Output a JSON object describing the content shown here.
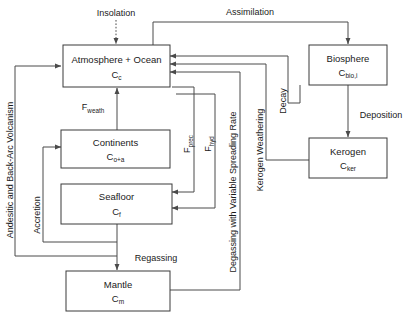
{
  "diagram": {
    "colors": {
      "background": "#ffffff",
      "box_stroke": "#3a3a3a",
      "line": "#4a4a4a",
      "text": "#1a1a1a"
    },
    "boxes": [
      {
        "id": "atmosphere-ocean",
        "label": "Atmosphere + Ocean",
        "symbol_base": "C",
        "symbol_sub": "c"
      },
      {
        "id": "continents",
        "label": "Continents",
        "symbol_base": "C",
        "symbol_sub": "o+a"
      },
      {
        "id": "seafloor",
        "label": "Seafloor",
        "symbol_base": "C",
        "symbol_sub": "f"
      },
      {
        "id": "mantle",
        "label": "Mantle",
        "symbol_base": "C",
        "symbol_sub": "m"
      },
      {
        "id": "biosphere",
        "label": "Biosphere",
        "symbol_base": "C",
        "symbol_sub": "bio,i"
      },
      {
        "id": "kerogen",
        "label": "Kerogen",
        "symbol_base": "C",
        "symbol_sub": "ker"
      }
    ],
    "flows": [
      {
        "id": "insolation",
        "label": "Insolation",
        "style": "dotted",
        "orientation": "horizontal"
      },
      {
        "id": "assimilation",
        "label": "Assimilation",
        "style": "solid",
        "orientation": "horizontal"
      },
      {
        "id": "decay",
        "label": "Decay",
        "style": "solid",
        "orientation": "vertical"
      },
      {
        "id": "deposition",
        "label": "Deposition",
        "style": "solid",
        "orientation": "horizontal"
      },
      {
        "id": "kerogen-weathering",
        "label": "Kerogen Weathering",
        "style": "solid",
        "orientation": "vertical"
      },
      {
        "id": "f-weath",
        "label_base": "F",
        "label_sub": "weath",
        "style": "solid",
        "orientation": "horizontal"
      },
      {
        "id": "f-prec",
        "label_base": "F",
        "label_sub": "prec",
        "style": "solid",
        "orientation": "vertical"
      },
      {
        "id": "f-hyd",
        "label_base": "F",
        "label_sub": "hyd",
        "style": "solid",
        "orientation": "vertical"
      },
      {
        "id": "degassing",
        "label": "Degassing with Variable Spreading Rate",
        "style": "solid",
        "orientation": "vertical"
      },
      {
        "id": "regassing",
        "label": "Regassing",
        "style": "solid",
        "orientation": "horizontal"
      },
      {
        "id": "accretion",
        "label": "Accretion",
        "style": "solid",
        "orientation": "vertical"
      },
      {
        "id": "volcanism",
        "label": "Andesitic and Back-Arc Volcanism",
        "style": "solid",
        "orientation": "vertical"
      }
    ]
  }
}
